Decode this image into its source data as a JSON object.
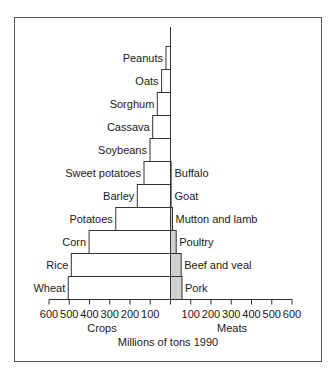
{
  "chart_data": {
    "type": "bar",
    "orientation": "horizontal-butterfly",
    "title": "Millions of tons 1990",
    "units": "Millions of tons",
    "left_panel": {
      "label": "Crops",
      "categories": [
        "Peanuts",
        "Oats",
        "Sorghum",
        "Cassava",
        "Soybeans",
        "Sweet potatoes",
        "Barley",
        "Potatoes",
        "Corn",
        "Rice",
        "Wheat"
      ],
      "values": [
        22,
        44,
        65,
        88,
        101,
        131,
        164,
        270,
        402,
        490,
        505
      ],
      "fill": "#ffffff"
    },
    "right_panel": {
      "label": "Meats",
      "categories": [
        "Buffalo",
        "Goat",
        "Mutton and lamb",
        "Poultry",
        "Beef and veal",
        "Pork"
      ],
      "values": [
        2,
        3,
        10,
        28,
        53,
        57
      ],
      "fill": "#d0d0d0"
    },
    "axis": {
      "range": [
        0,
        600
      ],
      "left_ticks": [
        600,
        500,
        400,
        300,
        200,
        100
      ],
      "right_ticks": [
        100,
        200,
        300,
        400,
        500,
        600
      ],
      "tick_labels_left": [
        "600",
        "500",
        "400",
        "300",
        "200",
        "100"
      ],
      "tick_labels_right": [
        "100",
        "200",
        "300",
        "400",
        "500",
        "600"
      ]
    },
    "xlabel": "Millions of tons 1990",
    "grid": false,
    "legend": "none"
  }
}
